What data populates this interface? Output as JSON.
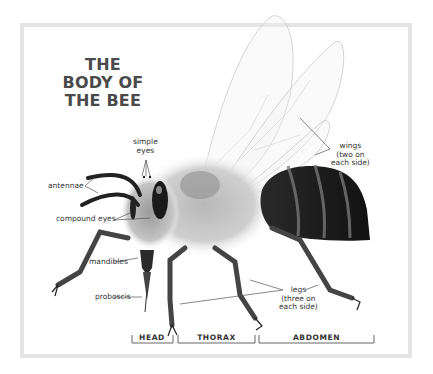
{
  "title": {
    "line1": "THE",
    "line2": "BODY OF",
    "line3": "THE BEE"
  },
  "labels": {
    "simple_eyes": {
      "line1": "simple",
      "line2": "eyes"
    },
    "antennae": "antennae",
    "compound_eyes": "compound eyes",
    "mandibles": "mandibles",
    "proboscis": "proboscis",
    "wings": {
      "line1": "wings",
      "line2": "(two on",
      "line3": "each side)"
    },
    "legs": {
      "line1": "legs",
      "line2": "(three on",
      "line3": "each side)"
    }
  },
  "segments": [
    {
      "label": "HEAD"
    },
    {
      "label": "THORAX"
    },
    {
      "label": "ABDOMEN"
    }
  ],
  "colors": {
    "frame": "#e4e4e4",
    "text": "#333333",
    "title": "#4a4a4a",
    "abdomen": "#1a1a1a",
    "thorax_fur": "#c8c8c8"
  }
}
